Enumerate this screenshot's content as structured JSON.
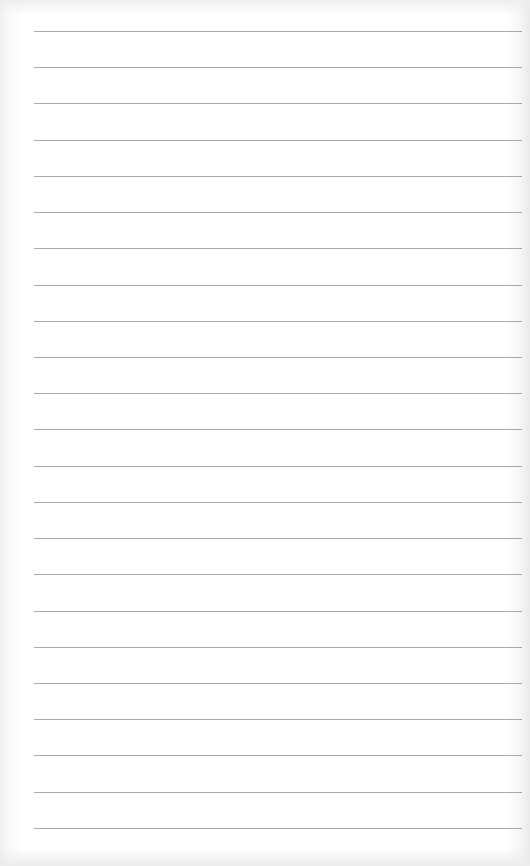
{
  "page": {
    "type": "lined-paper",
    "background_color": "#ffffff",
    "rule_color": "#9a9a9a",
    "rule_count": 23,
    "first_rule_y": 31,
    "rule_spacing": 36.22,
    "rule_left": 34,
    "rule_right": 522,
    "text": []
  }
}
